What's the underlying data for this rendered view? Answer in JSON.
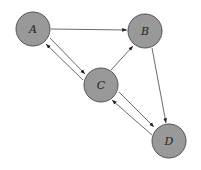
{
  "diagram": {
    "type": "directed-graph",
    "nodes": [
      {
        "id": "A",
        "label": "A",
        "x": 33,
        "y": 29
      },
      {
        "id": "B",
        "label": "B",
        "x": 145,
        "y": 31
      },
      {
        "id": "C",
        "label": "C",
        "x": 101,
        "y": 85
      },
      {
        "id": "D",
        "label": "D",
        "x": 169,
        "y": 141
      }
    ],
    "edges": [
      {
        "from": "A",
        "to": "B"
      },
      {
        "from": "B",
        "to": "D"
      },
      {
        "from": "C",
        "to": "B"
      },
      {
        "from": "A",
        "to": "C"
      },
      {
        "from": "C",
        "to": "A"
      },
      {
        "from": "C",
        "to": "D"
      },
      {
        "from": "D",
        "to": "C"
      }
    ],
    "node_color": "#999999"
  }
}
